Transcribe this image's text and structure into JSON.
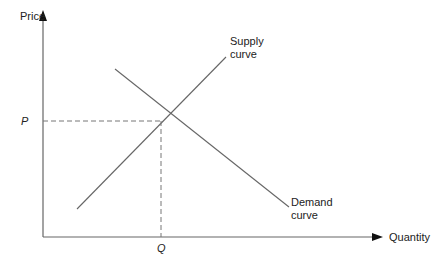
{
  "diagram": {
    "y_axis_label": "Price",
    "x_axis_label": "Quantity",
    "price_label": "P",
    "quantity_label": "Q",
    "supply_label_line1": "Supply",
    "supply_label_line2": "curve",
    "demand_label_line1": "Demand",
    "demand_label_line2": "curve",
    "line_color": "#555555"
  }
}
